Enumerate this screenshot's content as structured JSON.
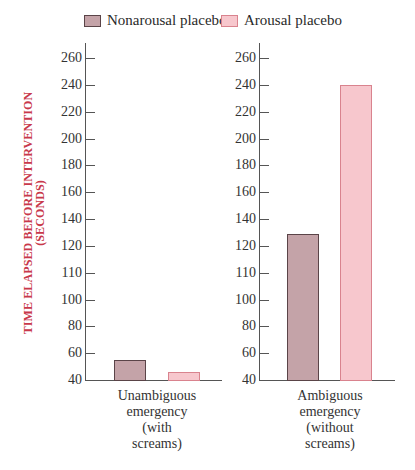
{
  "chart_data": {
    "type": "bar",
    "title": "",
    "ylabel": "TIME ELAPSED BEFORE INTERVENTION (SECONDS)",
    "ylabel_lines": [
      "TIME ELAPSED BEFORE INTERVENTION",
      "(SECONDS)"
    ],
    "xlabel": "",
    "ytick_labels": [
      "260",
      "240",
      "220",
      "200",
      "180",
      "160",
      "140",
      "120",
      "110",
      "100",
      "80",
      "60",
      "40"
    ],
    "ylim_displayed": [
      40,
      260
    ],
    "categories": [
      "Unambiguous emergency (with screams)",
      "Ambiguous emergency (without screams)"
    ],
    "category_label_lines": [
      [
        "Unambiguous",
        "emergency",
        "(with",
        "screams)"
      ],
      [
        "Ambiguous",
        "emergency",
        "(without",
        "screams)"
      ]
    ],
    "series": [
      {
        "name": "Nonarousal placebo",
        "color": "#c4a3a8",
        "border": "#5a4448",
        "values": [
          55,
          129
        ]
      },
      {
        "name": "Arousal placebo",
        "color": "#f7c7cd",
        "border": "#d9838e",
        "values": [
          46,
          240
        ]
      }
    ],
    "legend_position": "top",
    "grid": false,
    "panels": 2
  },
  "legend": {
    "items": [
      {
        "label": "Nonarousal placebo"
      },
      {
        "label": "Arousal placebo"
      }
    ]
  },
  "colors": {
    "axis_title": "#c8384a",
    "axis": "#555555"
  }
}
